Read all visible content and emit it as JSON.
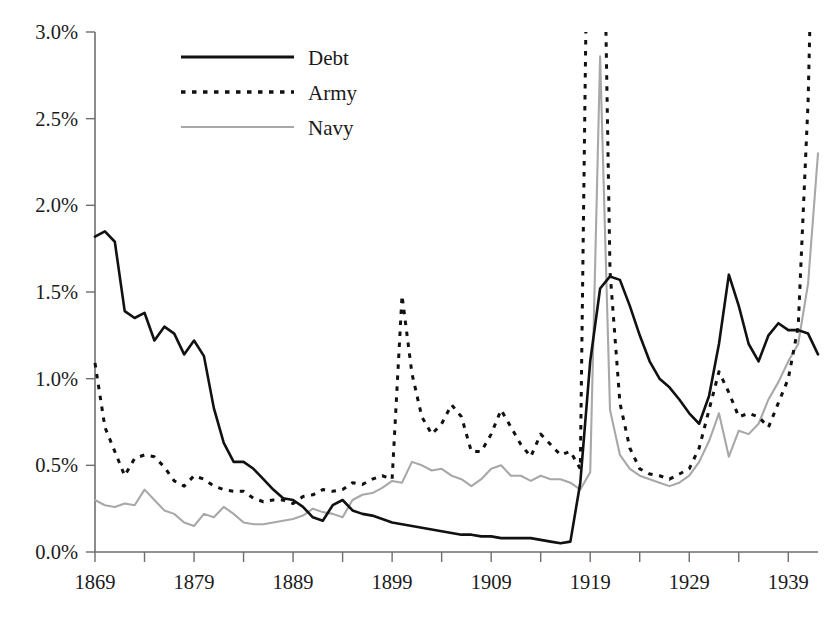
{
  "chart_data": {
    "type": "line",
    "title": "",
    "xlabel": "",
    "ylabel": "",
    "xlim": [
      1868,
      1943
    ],
    "ylim": [
      0.0,
      3.0
    ],
    "grid": false,
    "legend_position": "top-center",
    "y_tick_labels": [
      "0.0%",
      "0.5%",
      "1.0%",
      "1.5%",
      "2.0%",
      "2.5%",
      "3.0%"
    ],
    "y_tick_values": [
      0.0,
      0.5,
      1.0,
      1.5,
      2.0,
      2.5,
      3.0
    ],
    "x_tick_labels": [
      "1869",
      "1879",
      "1889",
      "1899",
      "1909",
      "1919",
      "1929",
      "1939"
    ],
    "x_tick_values": [
      1869,
      1879,
      1889,
      1899,
      1909,
      1919,
      1929,
      1939
    ],
    "x_minor_tick_values": [
      1874,
      1884,
      1894,
      1904,
      1914,
      1924,
      1934
    ],
    "x": [
      1869,
      1870,
      1871,
      1872,
      1873,
      1874,
      1875,
      1876,
      1877,
      1878,
      1879,
      1880,
      1881,
      1882,
      1883,
      1884,
      1885,
      1886,
      1887,
      1888,
      1889,
      1890,
      1891,
      1892,
      1893,
      1894,
      1895,
      1896,
      1897,
      1898,
      1899,
      1900,
      1901,
      1902,
      1903,
      1904,
      1905,
      1906,
      1907,
      1908,
      1909,
      1910,
      1911,
      1912,
      1913,
      1914,
      1915,
      1916,
      1917,
      1918,
      1919,
      1920,
      1921,
      1922,
      1923,
      1924,
      1925,
      1926,
      1927,
      1928,
      1929,
      1930,
      1931,
      1932,
      1933,
      1934,
      1935,
      1936,
      1937,
      1938,
      1939,
      1940,
      1941,
      1942
    ],
    "series": [
      {
        "name": "Debt",
        "style": "solid",
        "color": "#111111",
        "values": [
          1.82,
          1.85,
          1.79,
          1.39,
          1.35,
          1.38,
          1.22,
          1.3,
          1.26,
          1.14,
          1.22,
          1.13,
          0.83,
          0.63,
          0.52,
          0.52,
          0.48,
          0.42,
          0.36,
          0.31,
          0.3,
          0.26,
          0.2,
          0.18,
          0.27,
          0.3,
          0.24,
          0.22,
          0.21,
          0.19,
          0.17,
          0.16,
          0.15,
          0.14,
          0.13,
          0.12,
          0.11,
          0.1,
          0.1,
          0.09,
          0.09,
          0.08,
          0.08,
          0.08,
          0.08,
          0.07,
          0.06,
          0.05,
          0.06,
          0.4,
          1.1,
          1.52,
          1.59,
          1.57,
          1.42,
          1.25,
          1.1,
          1.0,
          0.95,
          0.88,
          0.8,
          0.74,
          0.9,
          1.2,
          1.6,
          1.42,
          1.2,
          1.1,
          1.25,
          1.32,
          1.28,
          1.28,
          1.26,
          1.14
        ]
      },
      {
        "name": "Army",
        "style": "dotted",
        "color": "#111111",
        "values": [
          1.09,
          0.72,
          0.58,
          0.44,
          0.54,
          0.56,
          0.55,
          0.49,
          0.41,
          0.38,
          0.44,
          0.42,
          0.38,
          0.36,
          0.35,
          0.35,
          0.31,
          0.29,
          0.3,
          0.3,
          0.28,
          0.32,
          0.33,
          0.36,
          0.35,
          0.36,
          0.4,
          0.39,
          0.42,
          0.44,
          0.42,
          1.48,
          1.03,
          0.78,
          0.68,
          0.74,
          0.85,
          0.78,
          0.58,
          0.58,
          0.68,
          0.82,
          0.72,
          0.62,
          0.55,
          0.68,
          0.62,
          0.56,
          0.58,
          0.48,
          5.0,
          5.0,
          1.62,
          0.86,
          0.6,
          0.48,
          0.45,
          0.44,
          0.42,
          0.45,
          0.48,
          0.6,
          0.82,
          1.04,
          0.92,
          0.78,
          0.8,
          0.78,
          0.72,
          0.86,
          1.0,
          1.3,
          2.6,
          5.0
        ]
      },
      {
        "name": "Navy",
        "style": "solid",
        "color": "#a8a8a8",
        "values": [
          0.3,
          0.27,
          0.26,
          0.28,
          0.27,
          0.36,
          0.3,
          0.24,
          0.22,
          0.17,
          0.15,
          0.22,
          0.2,
          0.26,
          0.22,
          0.17,
          0.16,
          0.16,
          0.17,
          0.18,
          0.19,
          0.21,
          0.25,
          0.23,
          0.22,
          0.2,
          0.3,
          0.33,
          0.34,
          0.37,
          0.41,
          0.4,
          0.52,
          0.5,
          0.47,
          0.48,
          0.44,
          0.42,
          0.38,
          0.42,
          0.48,
          0.5,
          0.44,
          0.44,
          0.41,
          0.44,
          0.42,
          0.42,
          0.4,
          0.36,
          0.46,
          2.86,
          0.82,
          0.56,
          0.48,
          0.44,
          0.42,
          0.4,
          0.38,
          0.4,
          0.44,
          0.52,
          0.64,
          0.8,
          0.55,
          0.7,
          0.68,
          0.74,
          0.88,
          0.98,
          1.1,
          1.2,
          1.55,
          2.3
        ]
      }
    ]
  },
  "legend": {
    "items": [
      {
        "label": "Debt"
      },
      {
        "label": "Army"
      },
      {
        "label": "Navy"
      }
    ]
  },
  "colors": {
    "debt": "#111111",
    "army": "#111111",
    "navy": "#a8a8a8",
    "axis": "#6e6e6e",
    "text": "#1a1a1a",
    "background": "#ffffff"
  }
}
